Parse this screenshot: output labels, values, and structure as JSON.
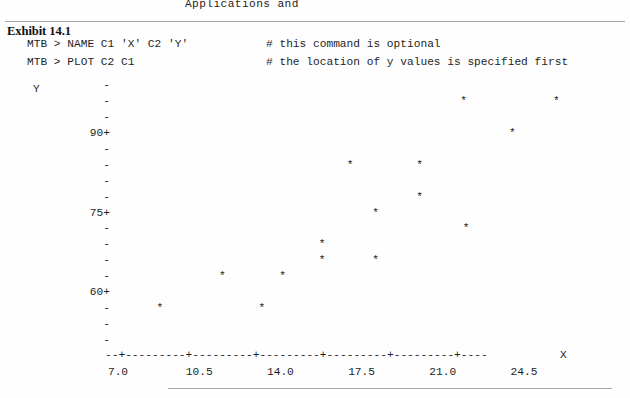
{
  "page": {
    "faded_top_text": "Applications and",
    "background": "#fefefe",
    "rule_color": "#a9a9a9"
  },
  "exhibit": {
    "title": "Exhibit 14.1"
  },
  "terminal": {
    "lines": [
      {
        "command": "MTB > NAME C1 'X' C2 'Y'",
        "comment": "# this command is optional"
      },
      {
        "command": "MTB > PLOT C2 C1",
        "comment": "# the location of y values is specified first"
      }
    ]
  },
  "chart_data": {
    "type": "scatter",
    "title": "Exhibit 14.1",
    "xlabel": "X",
    "ylabel": "Y",
    "marker": "*",
    "grid": false,
    "legend": null,
    "xlim": [
      7.0,
      26.25
    ],
    "ylim": [
      54,
      99
    ],
    "x_ticks": [
      "7.0",
      "10.5",
      "14.0",
      "17.5",
      "21.0",
      "24.5"
    ],
    "x_tick_values": [
      7.0,
      10.5,
      14.0,
      17.5,
      21.0,
      24.5
    ],
    "y_ticks": [
      "90+",
      "75+",
      "60+"
    ],
    "y_tick_values": [
      90,
      75,
      60
    ],
    "y_axis_rows": [
      {
        "label": "-",
        "value": 99
      },
      {
        "label": "-",
        "value": 96
      },
      {
        "label": "-",
        "value": 93
      },
      {
        "label": "90+",
        "value": 90
      },
      {
        "label": "-",
        "value": 87
      },
      {
        "label": "-",
        "value": 84
      },
      {
        "label": "-",
        "value": 81
      },
      {
        "label": "-",
        "value": 78
      },
      {
        "label": "75+",
        "value": 75
      },
      {
        "label": "-",
        "value": 72
      },
      {
        "label": "-",
        "value": 69
      },
      {
        "label": "-",
        "value": 66
      },
      {
        "label": "-",
        "value": 63
      },
      {
        "label": "60+",
        "value": 60
      },
      {
        "label": "-",
        "value": 57
      },
      {
        "label": "-",
        "value": 54
      },
      {
        "label": "-",
        "value": 51
      }
    ],
    "x_axis_line": "--+---------+---------+---------+---------+---------+----",
    "points": [
      {
        "x": 21.9,
        "y": 96
      },
      {
        "x": 25.9,
        "y": 96
      },
      {
        "x": 24.0,
        "y": 90
      },
      {
        "x": 17.0,
        "y": 84
      },
      {
        "x": 20.0,
        "y": 84
      },
      {
        "x": 20.0,
        "y": 78
      },
      {
        "x": 18.1,
        "y": 75
      },
      {
        "x": 22.0,
        "y": 72
      },
      {
        "x": 15.8,
        "y": 69
      },
      {
        "x": 15.8,
        "y": 66
      },
      {
        "x": 18.1,
        "y": 66
      },
      {
        "x": 11.5,
        "y": 63
      },
      {
        "x": 14.1,
        "y": 63
      },
      {
        "x": 8.8,
        "y": 57
      },
      {
        "x": 13.2,
        "y": 57
      }
    ]
  }
}
